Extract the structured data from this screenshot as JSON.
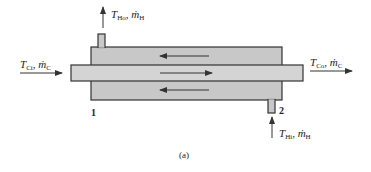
{
  "figure": {
    "caption": "(a)",
    "colors": {
      "shell_fill": "#c8c8c8",
      "tube_fill": "#d4d4d4",
      "outline": "#333333",
      "arrow": "#333333",
      "text": "#222222"
    }
  },
  "labels": {
    "cold_inlet": {
      "T": "T",
      "T_sub": "Ci",
      "sep": ", ",
      "m": "ṁ",
      "m_sub": "C"
    },
    "cold_outlet": {
      "T": "T",
      "T_sub": "Co",
      "sep": ", ",
      "m": "ṁ",
      "m_sub": "C"
    },
    "hot_outlet": {
      "T": "T",
      "T_sub": "Ho",
      "sep": ", ",
      "m": "ṁ",
      "m_sub": "H"
    },
    "hot_inlet": {
      "T": "T",
      "T_sub": "Hi",
      "sep": ", ",
      "m": "ṁ",
      "m_sub": "H"
    },
    "end_1": "1",
    "end_2": "2"
  },
  "flows": {
    "shell_top": "left",
    "tube": "right",
    "shell_bottom": "left"
  }
}
